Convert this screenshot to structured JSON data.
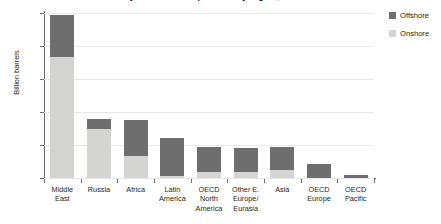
{
  "chart_data": {
    "type": "bar",
    "subtype": "stacked-vertical",
    "title": "...yet to be developed field by region, 2011",
    "xlabel": "",
    "ylabel": "Billion barrels",
    "ylim": [
      0,
      100
    ],
    "yticks": [
      0,
      20,
      40,
      60,
      80,
      100
    ],
    "ytick_labels": [
      "0",
      "20",
      "40",
      "60",
      "80",
      "100"
    ],
    "grid": true,
    "grid_axis": "y",
    "legend_position": "right",
    "categories": [
      "Middle East",
      "Russia",
      "Africa",
      "Latin America",
      "OECD North America",
      "Other E. Europe/ Eurasia",
      "Asia",
      "OECD Europe",
      "OECD Pacific"
    ],
    "category_label_lines": [
      [
        "Middle",
        "East"
      ],
      [
        "Russia"
      ],
      [
        "Africa"
      ],
      [
        "Latin",
        "America"
      ],
      [
        "OECD",
        "North",
        "America"
      ],
      [
        "Other E.",
        "Europe/",
        "Eurasia"
      ],
      [
        "Asia"
      ],
      [
        "OECD",
        "Europe"
      ],
      [
        "OECD",
        "Pacific"
      ]
    ],
    "series": [
      {
        "name": "Onshore",
        "color": "#d4d4d2",
        "values": [
          73.5,
          30.0,
          13.5,
          1.5,
          3.5,
          3.5,
          5.0,
          0.0,
          0.0
        ]
      },
      {
        "name": "Offshore",
        "color": "#6e6e6e",
        "values": [
          25.5,
          5.5,
          21.5,
          22.5,
          15.5,
          14.5,
          14.0,
          8.5,
          2.0
        ]
      }
    ],
    "totals": [
      99.0,
      35.5,
      35.0,
      24.0,
      19.0,
      18.0,
      19.0,
      8.5,
      2.0
    ],
    "units": "Billion barrels"
  },
  "legend": {
    "items": [
      {
        "label": "Offshore",
        "color": "#6e6e6e"
      },
      {
        "label": "Onshore",
        "color": "#d4d4d2"
      }
    ]
  }
}
